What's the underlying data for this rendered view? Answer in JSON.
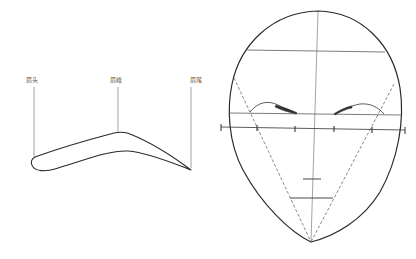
{
  "colors": {
    "background": "#ffffff",
    "stroke": "#2a2a2a",
    "thin_stroke": "#555555",
    "label": "#555555"
  },
  "eyebrow_diagram": {
    "labels": [
      {
        "key": "head",
        "text": "眉头",
        "x": 27,
        "y": 80
      },
      {
        "key": "peak",
        "text": "眉峰",
        "x": 111,
        "y": 80
      },
      {
        "key": "tail",
        "text": "眉尾",
        "x": 192,
        "y": 80
      }
    ]
  },
  "face_diagram": {
    "horizontal_ruler_ticks": 4,
    "has_center_line": true,
    "has_forehead_line": true,
    "has_brow_line": true,
    "has_dashed_triangle": true,
    "has_mouth_marks": true
  }
}
